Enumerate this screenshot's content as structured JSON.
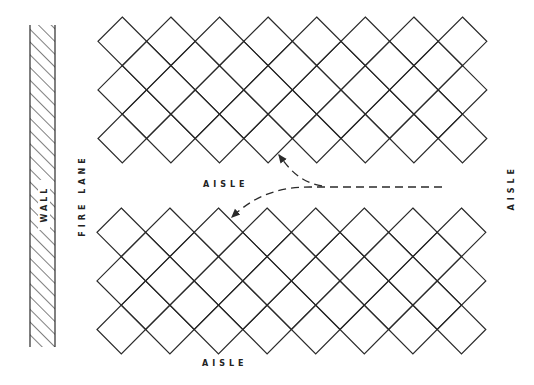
{
  "diagram": {
    "type": "warehouse-rack-layout",
    "labels": {
      "wall": "WALL",
      "fire_lane": "FIRE LANE",
      "aisle_middle": "AISLE",
      "aisle_bottom": "AISLE",
      "aisle_right": "AISLE"
    },
    "colors": {
      "line": "#2a2a2a",
      "background": "#ffffff"
    },
    "grids": [
      {
        "name": "upper-storage-block",
        "x0": 98,
        "y0": 17,
        "columns": 8,
        "rows": 3,
        "pitch": 48.6
      },
      {
        "name": "lower-storage-block",
        "x0": 97,
        "y0": 208,
        "columns": 8,
        "rows": 3,
        "pitch": 48.6
      }
    ],
    "wall": {
      "x": 30,
      "y": 25,
      "width": 25,
      "height": 322
    },
    "flow_arrows": [
      {
        "name": "arrow-to-upper-block",
        "from": "aisle",
        "to": "upper-storage-block"
      },
      {
        "name": "arrow-to-lower-block",
        "from": "aisle",
        "to": "lower-storage-block"
      }
    ]
  }
}
